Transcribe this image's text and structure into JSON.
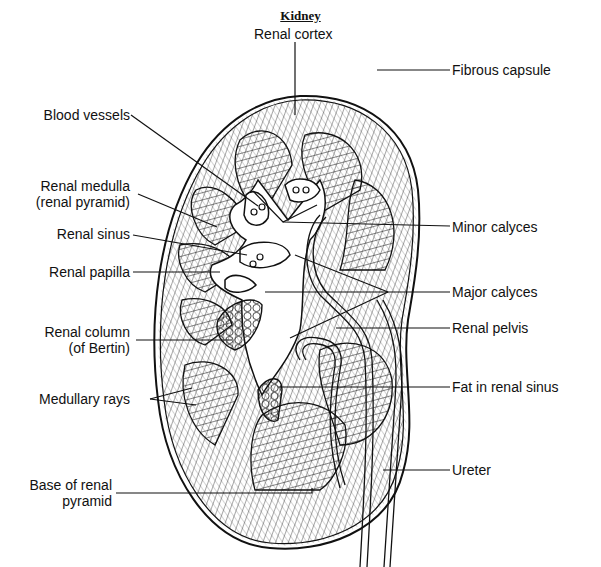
{
  "title": "Kidney",
  "colors": {
    "ink": "#111111",
    "background": "#ffffff"
  },
  "labels": {
    "renal_cortex": "Renal cortex",
    "fibrous_capsule": "Fibrous capsule",
    "blood_vessels": "Blood vessels",
    "renal_medulla_line1": "Renal medulla",
    "renal_medulla_line2": "(renal pyramid)",
    "renal_sinus": "Renal sinus",
    "minor_calyces": "Minor calyces",
    "renal_papilla": "Renal papilla",
    "major_calyces": "Major calyces",
    "renal_column_line1": "Renal column",
    "renal_column_line2": "(of Bertin)",
    "renal_pelvis": "Renal pelvis",
    "medullary_rays": "Medullary rays",
    "fat_in_renal_sinus": "Fat in renal sinus",
    "ureter": "Ureter",
    "base_pyramid_line1": "Base of renal",
    "base_pyramid_line2": "pyramid"
  }
}
